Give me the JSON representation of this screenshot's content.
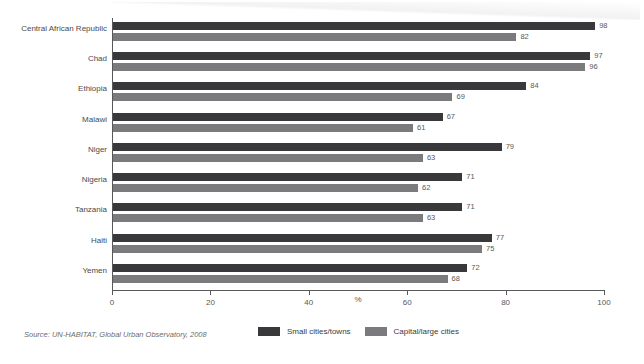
{
  "chart_data": {
    "type": "bar",
    "orientation": "horizontal",
    "title": "",
    "xlabel": "%",
    "ylabel": "",
    "xlim": [
      0,
      100
    ],
    "xticks": [
      0,
      20,
      40,
      60,
      80,
      100
    ],
    "xtick_labels": [
      "0",
      "20",
      "40",
      "60",
      "80",
      "100"
    ],
    "grid": false,
    "legend_position": "bottom-center",
    "categories": [
      "Central African Republic",
      "Chad",
      "Ethiopia",
      "Malawi",
      "Niger",
      "Nigeria",
      "Tanzania",
      "Haiti",
      "Yemen"
    ],
    "series": [
      {
        "name": "Small cities/towns",
        "color": "#39393b",
        "values": [
          98,
          97,
          84,
          67,
          79,
          71,
          71,
          77,
          72
        ]
      },
      {
        "name": "Capital/large cities",
        "color": "#7b7b7d",
        "values": [
          82,
          96,
          69,
          61,
          63,
          62,
          63,
          75,
          68
        ]
      }
    ]
  },
  "source_note": "Source: UN-HABITAT, Global Urban Observatory, 2008"
}
